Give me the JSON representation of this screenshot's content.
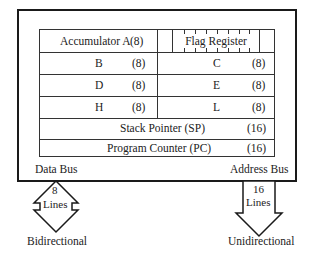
{
  "diagram": {
    "type": "register-architecture",
    "registers": {
      "accumulator": {
        "name": "Accumulator A",
        "size": "(8)"
      },
      "flag": {
        "name": "Flag Register"
      },
      "rows": [
        {
          "left": {
            "name": "B",
            "size": "(8)"
          },
          "right": {
            "name": "C",
            "size": "(8)"
          }
        },
        {
          "left": {
            "name": "D",
            "size": "(8)"
          },
          "right": {
            "name": "E",
            "size": "(8)"
          }
        },
        {
          "left": {
            "name": "H",
            "size": "(8)"
          },
          "right": {
            "name": "L",
            "size": "(8)"
          }
        }
      ],
      "stack_pointer": {
        "name": "Stack Pointer (SP)",
        "size": "(16)"
      },
      "program_counter": {
        "name": "Program Counter (PC)",
        "size": "(16)"
      }
    },
    "buses": {
      "data": {
        "label": "Data Bus",
        "width_top": "8",
        "width_bottom": "Lines",
        "direction": "Bidirectional"
      },
      "address": {
        "label": "Address Bus",
        "width_top": "16",
        "width_bottom": "Lines",
        "direction": "Unidirectional"
      }
    },
    "colors": {
      "line": "#1a1a1a",
      "text": "#222222",
      "background": "#ffffff"
    }
  }
}
